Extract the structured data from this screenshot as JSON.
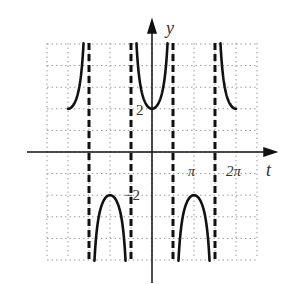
{
  "chart_data": {
    "type": "line",
    "title": "",
    "function": "y = 2 sec(t)",
    "xlabel": "t",
    "ylabel": "y",
    "xlim": [
      -7.854,
      7.854
    ],
    "ylim": [
      -5,
      5
    ],
    "grid": true,
    "x_tick_step": "π/2",
    "y_tick_step": 1,
    "tick_labels": {
      "x": [
        {
          "value": 3.1416,
          "label": "π"
        },
        {
          "value": 6.2832,
          "label": "2π"
        }
      ],
      "y": [
        {
          "value": 2,
          "label": "2"
        },
        {
          "value": -2,
          "label": "−2"
        }
      ]
    },
    "asymptotes": [
      -4.712,
      -1.571,
      1.571,
      4.712
    ],
    "series": [
      {
        "name": "2sec(t) branch",
        "x": [
          -6.283,
          -5.5,
          -5.0,
          -4.85
        ],
        "y": [
          2,
          2.82,
          7.05,
          14.3
        ]
      },
      {
        "name": "2sec(t) branch",
        "x": [
          -4.6,
          -4.0,
          -3.1416,
          -2.3,
          -1.7
        ],
        "y": [
          -17.9,
          -3.06,
          -2,
          -3.0,
          -15.4
        ]
      },
      {
        "name": "2sec(t) branch",
        "x": [
          -1.3,
          -0.8,
          0,
          0.8,
          1.3
        ],
        "y": [
          7.5,
          2.87,
          2,
          2.87,
          7.5
        ]
      },
      {
        "name": "2sec(t) branch",
        "x": [
          1.7,
          2.3,
          3.1416,
          4.0,
          4.6
        ],
        "y": [
          -15.4,
          -3.0,
          -2,
          -3.06,
          -17.9
        ]
      },
      {
        "name": "2sec(t) branch",
        "x": [
          4.85,
          5.0,
          5.5,
          6.283
        ],
        "y": [
          14.3,
          7.05,
          2.82,
          2
        ]
      }
    ]
  },
  "labels": {
    "y_axis": "y",
    "x_axis": "t",
    "y_pos": "2",
    "y_neg": "−2",
    "x_pi": "π",
    "x_2pi": "2π"
  }
}
